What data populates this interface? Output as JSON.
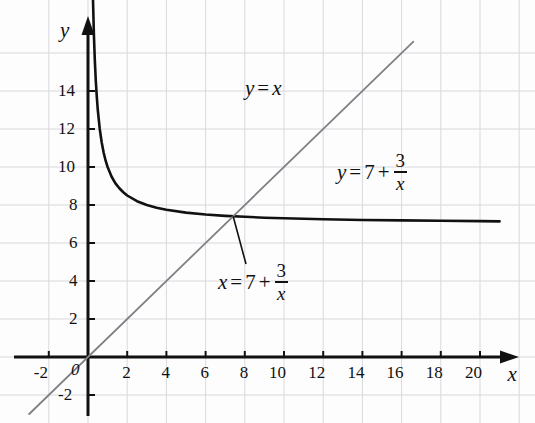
{
  "figure": {
    "kind": "graph",
    "background_color": "#fdfdfd",
    "grid_color": "#d9d9de",
    "axis_color": "#111111"
  },
  "axes": {
    "x_label": "x",
    "y_label": "y",
    "x_ticks": [
      "-2",
      "2",
      "4",
      "6",
      "8",
      "10",
      "12",
      "14",
      "16",
      "18",
      "20"
    ],
    "y_ticks": [
      "14",
      "12",
      "10",
      "8",
      "6",
      "4",
      "2",
      "-2"
    ],
    "origin_label": "0"
  },
  "annotations": {
    "line_label": {
      "lhs": "y",
      "eq": "=",
      "rhs": "x"
    },
    "curve_label": {
      "lhs": "y",
      "eq": "=",
      "int": "7",
      "plus": "+",
      "num": "3",
      "den": "x"
    },
    "intersection_label": {
      "lhs": "x",
      "eq": "=",
      "int": "7",
      "plus": "+",
      "num": "3",
      "den": "x"
    }
  },
  "chart_data": {
    "type": "line",
    "title": "",
    "xlabel": "x",
    "ylabel": "y",
    "xlim": [
      -2.8,
      22.8
    ],
    "ylim": [
      -3.2,
      15.8
    ],
    "grid": true,
    "grid_step": 2,
    "legend": "none",
    "xticks": [
      -2,
      0,
      2,
      4,
      6,
      8,
      10,
      12,
      14,
      16,
      18,
      20
    ],
    "yticks": [
      -2,
      0,
      2,
      4,
      6,
      8,
      10,
      12,
      14
    ],
    "series": [
      {
        "name": "y = 7 + 3/x",
        "equation": "y = 7 + 3/x",
        "color": "#111111",
        "width": 2.6,
        "x": [
          0.2,
          0.25,
          0.3,
          0.35,
          0.4,
          0.45,
          0.5,
          0.6,
          0.7,
          0.8,
          0.9,
          1.0,
          1.2,
          1.4,
          1.6,
          1.8,
          2.0,
          2.5,
          3.0,
          3.5,
          4.0,
          5.0,
          6.0,
          7.0,
          8.0,
          9.0,
          10.0,
          12.0,
          14.0,
          16.0,
          18.0,
          20.0,
          21.0
        ],
        "y": [
          22.0,
          19.0,
          17.0,
          15.57,
          14.5,
          13.67,
          13.0,
          12.0,
          11.29,
          10.75,
          10.33,
          10.0,
          9.5,
          9.14,
          8.88,
          8.67,
          8.5,
          8.2,
          8.0,
          7.86,
          7.75,
          7.6,
          7.5,
          7.43,
          7.38,
          7.33,
          7.3,
          7.25,
          7.21,
          7.19,
          7.17,
          7.15,
          7.14
        ]
      },
      {
        "name": "y = x",
        "equation": "y = x",
        "color": "#808086",
        "width": 1.8,
        "x": [
          -3.0,
          16.6
        ],
        "y": [
          -3.0,
          16.6
        ]
      }
    ],
    "points_of_interest": [
      {
        "name": "intersection",
        "x": 7.405,
        "y": 7.405,
        "label": "x = 7 + 3/x"
      }
    ]
  }
}
